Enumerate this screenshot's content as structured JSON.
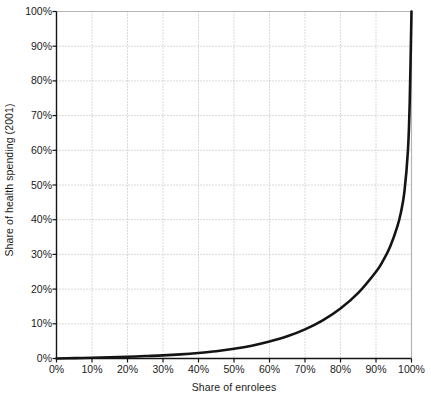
{
  "chart_data": {
    "type": "line",
    "title": "",
    "xlabel": "Share of enrolees",
    "ylabel": "Share of health spending (2001)",
    "xlim": [
      0,
      100
    ],
    "ylim": [
      0,
      100
    ],
    "grid": true,
    "legend": "none",
    "x_tick_labels": [
      "0%",
      "10%",
      "20%",
      "30%",
      "40%",
      "50%",
      "60%",
      "70%",
      "80%",
      "90%",
      "100%"
    ],
    "y_tick_labels": [
      "0%",
      "10%",
      "20%",
      "30%",
      "40%",
      "50%",
      "60%",
      "70%",
      "80%",
      "90%",
      "100%"
    ],
    "x_ticks": [
      0,
      10,
      20,
      30,
      40,
      50,
      60,
      70,
      80,
      90,
      100
    ],
    "y_ticks": [
      0,
      10,
      20,
      30,
      40,
      50,
      60,
      70,
      80,
      90,
      100
    ],
    "series": [
      {
        "name": "Concentration curve of health spending",
        "color": "#141414",
        "line_width": 2.6,
        "x": [
          0,
          5,
          10,
          15,
          20,
          25,
          30,
          35,
          40,
          45,
          50,
          55,
          60,
          65,
          70,
          75,
          80,
          85,
          90,
          92,
          94,
          96,
          97,
          98,
          99,
          99.5,
          100
        ],
        "y": [
          0,
          0.1,
          0.2,
          0.35,
          0.5,
          0.7,
          0.9,
          1.2,
          1.6,
          2.1,
          2.8,
          3.7,
          4.9,
          6.4,
          8.4,
          11.0,
          14.4,
          18.9,
          25.0,
          28.2,
          32.3,
          38.0,
          42.0,
          48.0,
          60.0,
          74.0,
          100.0
        ]
      }
    ]
  },
  "axes": {
    "x_axis_color": "#141414",
    "y_axis_color": "#141414",
    "grid_color": "#b4b4b4",
    "frame_top_color": "#b4b4b4",
    "frame_right_color": "#b4b4b4"
  },
  "labels": {
    "y_axis_title": "Share of health spending (2001)",
    "x_axis_title": "Share of enrolees"
  }
}
